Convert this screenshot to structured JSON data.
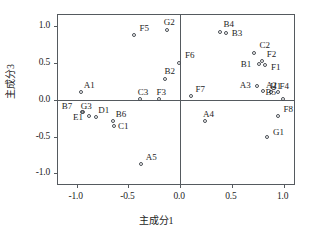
{
  "chart_data": {
    "type": "scatter",
    "title": "",
    "xlabel": "主成分1",
    "ylabel": "主成分3",
    "xlim": [
      -1.18,
      1.12
    ],
    "ylim": [
      -1.17,
      1.15
    ],
    "xticks": [
      "-1.0",
      "-0.5",
      "0.0",
      "0.5",
      "1.0"
    ],
    "xtick_values": [
      -1.0,
      -0.5,
      0.0,
      0.5,
      1.0
    ],
    "yticks": [
      "1.0",
      "0.5",
      "0.0",
      "-0.5",
      "-1.0"
    ],
    "ytick_values": [
      1.0,
      0.5,
      0.0,
      -0.5,
      -1.0
    ],
    "grid": false,
    "legend": "none",
    "marker": "open-circle",
    "points": [
      {
        "label": "F5",
        "x": -0.45,
        "y": 0.88,
        "lx": 6,
        "ly": -11
      },
      {
        "label": "G2",
        "x": -0.13,
        "y": 0.95,
        "lx": -3,
        "ly": -12
      },
      {
        "label": "B4",
        "x": 0.39,
        "y": 0.92,
        "lx": 3,
        "ly": -12
      },
      {
        "label": "B3",
        "x": 0.44,
        "y": 0.9,
        "lx": 6,
        "ly": -4
      },
      {
        "label": "C2",
        "x": 0.71,
        "y": 0.63,
        "lx": 6,
        "ly": -12
      },
      {
        "label": "F2",
        "x": 0.79,
        "y": 0.52,
        "lx": 5,
        "ly": -11
      },
      {
        "label": "F1",
        "x": 0.82,
        "y": 0.47,
        "lx": 6,
        "ly": -2
      },
      {
        "label": "B1",
        "x": 0.76,
        "y": 0.49,
        "lx": -18,
        "ly": -4
      },
      {
        "label": "F6",
        "x": -0.01,
        "y": 0.5,
        "lx": 6,
        "ly": -12
      },
      {
        "label": "B2",
        "x": -0.15,
        "y": 0.28,
        "lx": 0,
        "ly": -12
      },
      {
        "label": "A3",
        "x": 0.74,
        "y": 0.18,
        "lx": -17,
        "ly": -5
      },
      {
        "label": "A2",
        "x": 0.8,
        "y": 0.12,
        "lx": 3,
        "ly": -10
      },
      {
        "label": "H1",
        "x": 0.88,
        "y": 0.11,
        "lx": -1,
        "ly": -10
      },
      {
        "label": "F4",
        "x": 0.95,
        "y": 0.11,
        "lx": 1,
        "ly": -10
      },
      {
        "label": "A1",
        "x": -0.96,
        "y": 0.1,
        "lx": 3,
        "ly": -11
      },
      {
        "label": "F3",
        "x": -0.2,
        "y": 0.01,
        "lx": -3,
        "ly": -11
      },
      {
        "label": "C3",
        "x": -0.39,
        "y": 0.01,
        "lx": -2,
        "ly": -11
      },
      {
        "label": "F7",
        "x": 0.11,
        "y": 0.05,
        "lx": 4,
        "ly": -11
      },
      {
        "label": "B5",
        "x": 0.99,
        "y": 0.01,
        "lx": -17,
        "ly": -11
      },
      {
        "label": "B7",
        "x": -0.95,
        "y": -0.17,
        "lx": -20,
        "ly": -10
      },
      {
        "label": "G3",
        "x": -0.94,
        "y": -0.17,
        "lx": -2,
        "ly": -10
      },
      {
        "label": "E1",
        "x": -0.88,
        "y": -0.22,
        "lx": -16,
        "ly": -3
      },
      {
        "label": "D1",
        "x": -0.81,
        "y": -0.24,
        "lx": 2,
        "ly": -11
      },
      {
        "label": "B6",
        "x": -0.65,
        "y": -0.29,
        "lx": 3,
        "ly": -11
      },
      {
        "label": "C1",
        "x": -0.64,
        "y": -0.36,
        "lx": 4,
        "ly": -4
      },
      {
        "label": "F8",
        "x": 0.95,
        "y": -0.22,
        "lx": 5,
        "ly": -11
      },
      {
        "label": "A4",
        "x": 0.24,
        "y": -0.29,
        "lx": -2,
        "ly": -11
      },
      {
        "label": "G1",
        "x": 0.84,
        "y": -0.5,
        "lx": 6,
        "ly": -9
      },
      {
        "label": "A5",
        "x": -0.38,
        "y": -0.87,
        "lx": 5,
        "ly": -11
      }
    ]
  }
}
